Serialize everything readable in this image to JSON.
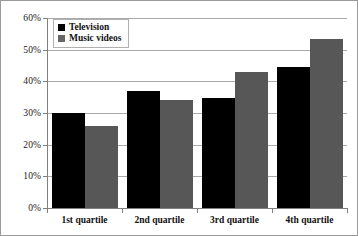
{
  "chart_data": {
    "type": "bar",
    "title": "",
    "subtitle": "",
    "xlabel": "",
    "ylabel": "",
    "categories": [
      "1st quartile",
      "2nd quartile",
      "3rd quartile",
      "4th quartile"
    ],
    "series": [
      {
        "name": "Television",
        "color": "#000000",
        "values": [
          30,
          37,
          34.7,
          44.5
        ]
      },
      {
        "name": "Music videos",
        "color": "#575757",
        "values": [
          26,
          34,
          43,
          53.5
        ]
      }
    ],
    "ylim": [
      0,
      60
    ],
    "ytick_values": [
      0,
      10,
      20,
      30,
      40,
      50,
      60
    ],
    "ytick_labels": [
      "0%",
      "10%",
      "20%",
      "30%",
      "40%",
      "50%",
      "60%"
    ],
    "grid": true,
    "grid_axis": "y",
    "legend_position": "top-left",
    "value_suffix": "%"
  },
  "legend": {
    "entries": [
      {
        "label": "Television",
        "swatch": "legend-swatch-black"
      },
      {
        "label": "Music videos",
        "swatch": "legend-swatch-gray"
      }
    ]
  }
}
